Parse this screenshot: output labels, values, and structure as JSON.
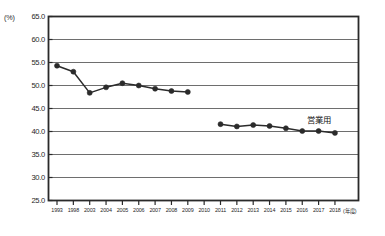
{
  "chart_data": {
    "type": "line",
    "title": "",
    "subtitle": "",
    "xlabel": "(年度)",
    "ylabel": "(%)",
    "unit_label": "(%)",
    "grid": true,
    "legend_position": "inline-right",
    "ylim": [
      25.0,
      65.0
    ],
    "ytick_step": 5.0,
    "ytick_labels": [
      "65.0",
      "60.0",
      "55.0",
      "50.0",
      "45.0",
      "40.0",
      "35.0",
      "30.0",
      "25.0"
    ],
    "ytick_values": [
      65.0,
      60.0,
      55.0,
      50.0,
      45.0,
      40.0,
      35.0,
      30.0,
      25.0
    ],
    "categories": [
      "1993",
      "1998",
      "2003",
      "2004",
      "2005",
      "2006",
      "2007",
      "2008",
      "2009",
      "2010",
      "2011",
      "2012",
      "2013",
      "2014",
      "2015",
      "2016",
      "2017",
      "2018"
    ],
    "series": [
      {
        "name": "",
        "x": [
          "1993",
          "1998",
          "2003",
          "2004",
          "2005",
          "2006",
          "2007",
          "2008",
          "2009",
          "2010"
        ],
        "values": [
          54.3,
          53.0,
          48.4,
          49.6,
          50.5,
          50.0,
          49.3,
          48.8,
          48.6,
          null
        ]
      },
      {
        "name": "営業用",
        "label": "営業用",
        "x": [
          "2011",
          "2012",
          "2013",
          "2014",
          "2015",
          "2016",
          "2017",
          "2018"
        ],
        "values": [
          41.6,
          41.1,
          41.4,
          41.2,
          40.7,
          40.1,
          40.1,
          39.7
        ]
      }
    ],
    "annotations": [
      {
        "text": "営業用",
        "attached_to_series": 1
      }
    ],
    "colors": {
      "marker": "#2b2b2b",
      "line": "#2b2b2b",
      "grid": "#6e6e6e",
      "frame": "#2a2a2a",
      "background": "#ffffff"
    }
  }
}
